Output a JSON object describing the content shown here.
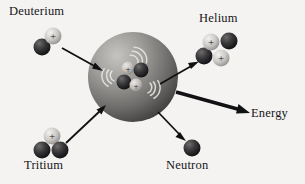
{
  "diagram": {
    "background_color": "#f4f3f1",
    "labels": {
      "deuterium": "Deuterium",
      "helium": "Helium",
      "tritium": "Tritium",
      "neutron": "Neutron",
      "energy": "Energy"
    },
    "core": {
      "name": "fusion-core-sphere",
      "center": [
        133,
        77
      ],
      "radius": 45,
      "fill_light": "#b9b7b4",
      "fill_dark": "#4c4a49"
    },
    "particles": {
      "proton_color": "#cfcdca",
      "neutron_color": "#262526",
      "proton_symbol": "+",
      "groups": [
        {
          "group": "deuterium",
          "items": [
            {
              "type": "proton",
              "cx": 53,
              "cy": 36,
              "r": 8.5
            },
            {
              "type": "neutron",
              "cx": 42,
              "cy": 47,
              "r": 8.5
            }
          ]
        },
        {
          "group": "tritium",
          "items": [
            {
              "type": "proton",
              "cx": 52,
              "cy": 136,
              "r": 8.5
            },
            {
              "type": "neutron",
              "cx": 42,
              "cy": 150,
              "r": 8.5
            },
            {
              "type": "neutron",
              "cx": 60,
              "cy": 150,
              "r": 8.5
            }
          ]
        },
        {
          "group": "helium",
          "items": [
            {
              "type": "proton",
              "cx": 211,
              "cy": 42,
              "r": 8.5
            },
            {
              "type": "neutron",
              "cx": 229,
              "cy": 41,
              "r": 8.5
            },
            {
              "type": "neutron",
              "cx": 204,
              "cy": 56,
              "r": 8.5
            },
            {
              "type": "proton",
              "cx": 221,
              "cy": 58,
              "r": 8.5
            }
          ]
        },
        {
          "group": "neutron",
          "items": [
            {
              "type": "neutron",
              "cx": 192,
              "cy": 148,
              "r": 8.5
            }
          ]
        },
        {
          "group": "core-nucleus",
          "items": [
            {
              "type": "proton",
              "cx": 128,
              "cy": 68,
              "r": 6.5
            },
            {
              "type": "neutron",
              "cx": 141,
              "cy": 70,
              "r": 7.5
            },
            {
              "type": "neutron",
              "cx": 124,
              "cy": 82,
              "r": 7.5
            },
            {
              "type": "proton",
              "cx": 136,
              "cy": 85,
              "r": 6.5
            }
          ]
        }
      ]
    },
    "arrows": [
      {
        "name": "arrow-deuterium-in",
        "x1": 62,
        "y1": 48,
        "x2": 101,
        "y2": 70,
        "width": 1.8,
        "head": 5.5
      },
      {
        "name": "arrow-tritium-in",
        "x1": 66,
        "y1": 143,
        "x2": 104,
        "y2": 107,
        "width": 1.8,
        "head": 5.5
      },
      {
        "name": "arrow-helium-out",
        "x1": 160,
        "y1": 84,
        "x2": 196,
        "y2": 63,
        "width": 1.8,
        "head": 5.5
      },
      {
        "name": "arrow-neutron-out",
        "x1": 158,
        "y1": 112,
        "x2": 184,
        "y2": 139,
        "width": 1.8,
        "head": 5.5
      },
      {
        "name": "arrow-energy-out",
        "x1": 176,
        "y1": 92,
        "x2": 249,
        "y2": 113,
        "width": 3.4,
        "head": 8.5
      }
    ],
    "radiation_waves": [
      {
        "name": "wave-upper",
        "cx": 134,
        "cy": 62,
        "rotate": -35
      },
      {
        "name": "wave-left",
        "cx": 112,
        "cy": 76,
        "rotate": 195
      },
      {
        "name": "wave-lower",
        "cx": 148,
        "cy": 88,
        "rotate": 20
      }
    ]
  }
}
